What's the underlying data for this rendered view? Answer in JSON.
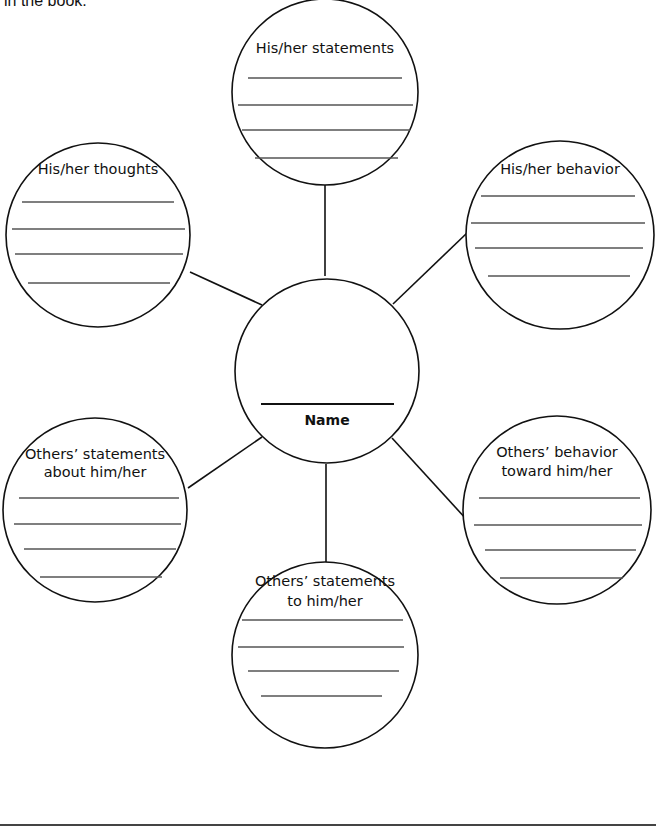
{
  "caption": "in the book.",
  "center": {
    "label": "Name"
  },
  "bubbles": [
    {
      "id": "top",
      "lines": [
        "His/her statements"
      ]
    },
    {
      "id": "top-left",
      "lines": [
        "His/her thoughts"
      ]
    },
    {
      "id": "top-right",
      "lines": [
        "His/her behavior"
      ]
    },
    {
      "id": "bottom-left",
      "lines": [
        "Others’ statements",
        "about him/her"
      ]
    },
    {
      "id": "bottom-right",
      "lines": [
        "Others’ behavior",
        "toward him/her"
      ]
    },
    {
      "id": "bottom",
      "lines": [
        "Others’ statements",
        "to him/her"
      ]
    }
  ],
  "colors": {
    "stroke": "#111111",
    "rule": "#555555",
    "background": "#ffffff"
  }
}
